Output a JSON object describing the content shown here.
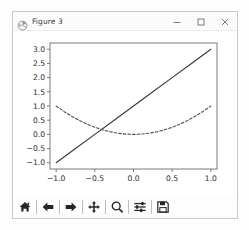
{
  "window": {
    "title": "Figure 3",
    "app_icon": "matplotlib-icon",
    "controls": [
      {
        "name": "minimize-button",
        "glyph": "minimize-icon"
      },
      {
        "name": "maximize-button",
        "glyph": "maximize-icon"
      },
      {
        "name": "close-button",
        "glyph": "close-icon"
      }
    ]
  },
  "toolbar": {
    "buttons": [
      {
        "name": "home-button",
        "icon": "home-icon",
        "tooltip": "Reset original view"
      },
      {
        "name": "back-button",
        "icon": "arrow-left-icon",
        "tooltip": "Back to previous view"
      },
      {
        "name": "forward-button",
        "icon": "arrow-right-icon",
        "tooltip": "Forward to next view"
      },
      {
        "name": "pan-button",
        "icon": "move-cross-icon",
        "tooltip": "Pan axes with left mouse, zoom with right"
      },
      {
        "name": "zoom-button",
        "icon": "magnifier-icon",
        "tooltip": "Zoom to rectangle"
      },
      {
        "name": "configure-subplots-button",
        "icon": "sliders-icon",
        "tooltip": "Configure subplots"
      },
      {
        "name": "save-button",
        "icon": "floppy-disk-icon",
        "tooltip": "Save the figure"
      }
    ]
  },
  "chart_data": {
    "type": "line",
    "title": "",
    "xlabel": "",
    "ylabel": "",
    "xlim": [
      -1.08,
      1.08
    ],
    "ylim": [
      -1.22,
      3.22
    ],
    "xticks": [
      -1.0,
      -0.5,
      0.0,
      0.5,
      1.0
    ],
    "xtick_labels": [
      "-1.0",
      "-0.5",
      "0.0",
      "0.5",
      "1.0"
    ],
    "yticks": [
      -1.0,
      -0.5,
      0.0,
      0.5,
      1.0,
      1.5,
      2.0,
      2.5,
      3.0
    ],
    "ytick_labels": [
      "-1.0",
      "-0.5",
      "0.0",
      "0.5",
      "1.0",
      "1.5",
      "2.0",
      "2.5",
      "3.0"
    ],
    "grid": false,
    "legend": null,
    "colors": {
      "line1": "#3a3a3a",
      "line2": "#555555",
      "axes": "#7a7a7a",
      "background": "#ffffff"
    },
    "series": [
      {
        "name": "y = 2x + 1",
        "style": "solid",
        "color": "#3a3a3a",
        "x": [
          -1.0,
          -0.75,
          -0.5,
          -0.25,
          0.0,
          0.25,
          0.5,
          0.75,
          1.0
        ],
        "values": [
          -1.0,
          -0.5,
          0.0,
          0.5,
          1.0,
          1.5,
          2.0,
          2.5,
          3.0
        ]
      },
      {
        "name": "y = x^2",
        "style": "dashed",
        "color": "#555555",
        "x": [
          -1.0,
          -0.9,
          -0.8,
          -0.7,
          -0.6,
          -0.5,
          -0.4,
          -0.3,
          -0.2,
          -0.1,
          0.0,
          0.1,
          0.2,
          0.3,
          0.4,
          0.5,
          0.6,
          0.7,
          0.8,
          0.9,
          1.0
        ],
        "values": [
          1.0,
          0.81,
          0.64,
          0.49,
          0.36,
          0.25,
          0.16,
          0.09,
          0.04,
          0.01,
          0.0,
          0.01,
          0.04,
          0.09,
          0.16,
          0.25,
          0.36,
          0.49,
          0.64,
          0.81,
          1.0
        ]
      }
    ]
  }
}
